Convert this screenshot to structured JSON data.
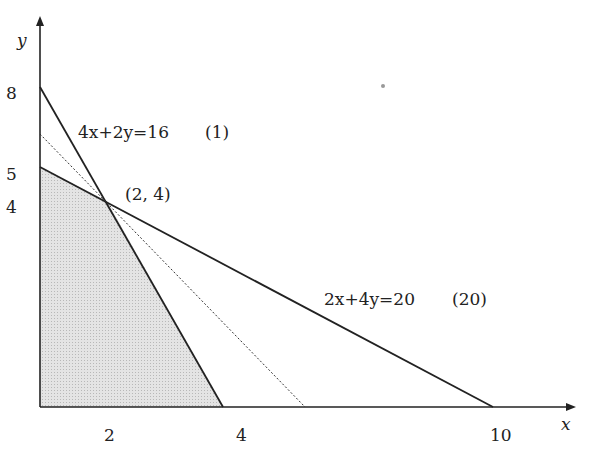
{
  "diagram": {
    "type": "linear-programming-feasible-region",
    "axes": {
      "x_label": "x",
      "y_label": "y",
      "x_ticks": [
        "2",
        "4",
        "10"
      ],
      "y_ticks": [
        "8",
        "5",
        "4"
      ]
    },
    "constraints": [
      {
        "equation": "4x+2y=16",
        "tag": "(1)",
        "x_intercept": 4,
        "y_intercept": 8
      },
      {
        "equation": "2x+4y=20",
        "tag": "(20)",
        "x_intercept": 10,
        "y_intercept": 5
      }
    ],
    "intersection_point": "(2, 4)",
    "objective_line": {
      "style": "dotted"
    },
    "feasible_region": {
      "vertices": [
        [
          0,
          0
        ],
        [
          0,
          5
        ],
        [
          2,
          4
        ],
        [
          4,
          0
        ]
      ],
      "fill": "#d9d9d9"
    },
    "colors": {
      "line": "#222222",
      "shade": "#d9d9d9"
    }
  }
}
